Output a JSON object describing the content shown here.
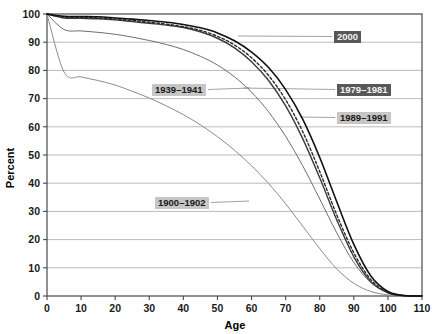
{
  "chart_data": {
    "type": "line",
    "title": "",
    "subtitle": "",
    "xlabel": "Age",
    "ylabel": "Percent",
    "xlim": [
      0,
      110
    ],
    "ylim": [
      0,
      100
    ],
    "xticks": [
      0,
      10,
      20,
      30,
      40,
      50,
      60,
      70,
      80,
      90,
      100,
      110
    ],
    "yticks": [
      0,
      10,
      20,
      30,
      40,
      50,
      60,
      70,
      80,
      90,
      100
    ],
    "grid": "horizontal",
    "legend_position": "inline-callouts",
    "x": [
      0,
      5,
      10,
      15,
      20,
      25,
      30,
      35,
      40,
      45,
      50,
      55,
      60,
      65,
      70,
      75,
      80,
      85,
      90,
      95,
      100,
      105,
      110
    ],
    "series": [
      {
        "name": "1900-1902",
        "label": "1900–1902",
        "style": "solid",
        "color": "#8c8c8c",
        "width": 1,
        "label_style": "light",
        "label_x": 155,
        "label_y": 197,
        "leader_to_x": 249,
        "leader_to_y": 201,
        "values": [
          100,
          79.4,
          77.7,
          76.4,
          74.8,
          72.6,
          70.2,
          67.4,
          64.3,
          60.7,
          56.5,
          51.7,
          46.2,
          39.9,
          32.7,
          24.8,
          16.8,
          9.6,
          4.5,
          1.6,
          0.4,
          0.05,
          0
        ]
      },
      {
        "name": "1939-1941",
        "label": "1939–1941",
        "style": "solid",
        "color": "#6e6e6e",
        "width": 1,
        "label_style": "light",
        "label_x": 152,
        "label_y": 84,
        "leader_to_x": 250,
        "leader_to_y": 88,
        "values": [
          100,
          94.5,
          94.0,
          93.5,
          92.8,
          91.8,
          90.6,
          89.2,
          87.4,
          85.0,
          81.9,
          77.7,
          72.3,
          65.3,
          56.6,
          46.2,
          34.4,
          22.4,
          11.9,
          4.7,
          1.2,
          0.15,
          0
        ]
      },
      {
        "name": "1979-1981",
        "label": "1979–1981",
        "style": "solid",
        "color": "#3a3a3a",
        "width": 1.4,
        "label_style": "dark",
        "label_x": 337,
        "label_y": 84,
        "leader_to_x": 243,
        "leader_to_y": 88,
        "values": [
          100,
          98.6,
          98.5,
          98.3,
          97.9,
          97.3,
          96.7,
          96.1,
          95.2,
          93.7,
          91.4,
          88.0,
          83.1,
          76.4,
          67.4,
          55.8,
          41.9,
          27.0,
          13.9,
          5.1,
          1.1,
          0.1,
          0
        ]
      },
      {
        "name": "1989-1991",
        "label": "1989–1991",
        "style": "dashed",
        "color": "#2b2b2b",
        "width": 1.4,
        "label_style": "light",
        "label_x": 337,
        "label_y": 112,
        "leader_to_x": 300,
        "leader_to_y": 117,
        "values": [
          100,
          98.9,
          98.8,
          98.6,
          98.2,
          97.7,
          97.1,
          96.4,
          95.5,
          94.2,
          92.1,
          89.0,
          84.5,
          78.2,
          69.6,
          58.3,
          44.1,
          28.8,
          15.3,
          5.8,
          1.3,
          0.12,
          0
        ]
      },
      {
        "name": "2000",
        "label": "2000",
        "style": "solid",
        "color": "#111111",
        "width": 1.6,
        "label_style": "dark",
        "label_x": 334,
        "label_y": 31,
        "leader_to_x": 238,
        "leader_to_y": 36,
        "values": [
          100,
          99.2,
          99.1,
          99.0,
          98.6,
          98.2,
          97.7,
          97.1,
          96.3,
          95.1,
          93.3,
          90.5,
          86.5,
          81.0,
          73.2,
          62.7,
          49.1,
          33.4,
          18.3,
          7.1,
          1.6,
          0.15,
          0
        ]
      }
    ]
  }
}
